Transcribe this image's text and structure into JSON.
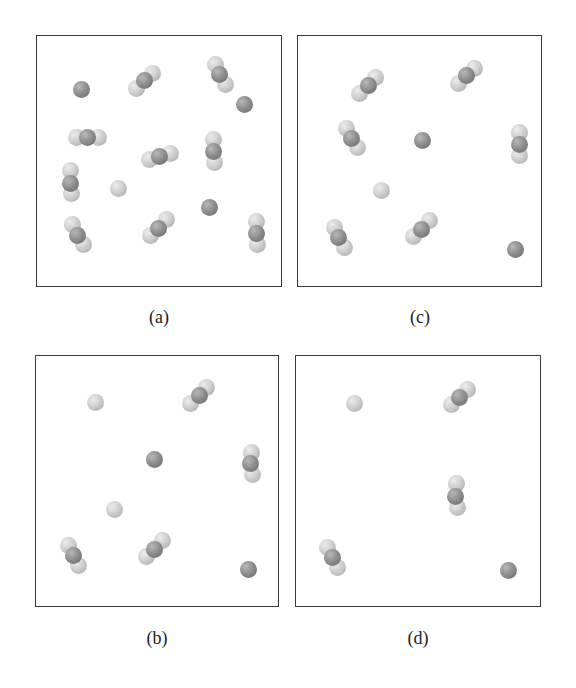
{
  "figure": {
    "atom_colors": {
      "light": "#cfcfcf",
      "dark": "#8f8f8f"
    },
    "panels": [
      {
        "id": "a",
        "label": "(a)",
        "box": {
          "left": 36,
          "top": 35,
          "width": 246,
          "height": 252
        },
        "label_pos": {
          "x": 159,
          "y": 307
        },
        "molecules": [
          {
            "type": "atom",
            "atoms": [
              {
                "x": 44,
                "y": 53,
                "c": "dark"
              }
            ]
          },
          {
            "type": "triatomic",
            "atoms": [
              {
                "x": 115,
                "y": 37,
                "c": "light"
              },
              {
                "x": 99,
                "y": 52,
                "c": "light"
              },
              {
                "x": 107,
                "y": 44,
                "c": "dark"
              }
            ]
          },
          {
            "type": "triatomic",
            "atoms": [
              {
                "x": 178,
                "y": 28,
                "c": "light"
              },
              {
                "x": 188,
                "y": 48,
                "c": "light"
              },
              {
                "x": 182,
                "y": 38,
                "c": "dark"
              }
            ]
          },
          {
            "type": "atom",
            "atoms": [
              {
                "x": 207,
                "y": 68,
                "c": "dark"
              }
            ]
          },
          {
            "type": "triatomic",
            "atoms": [
              {
                "x": 39,
                "y": 101,
                "c": "light"
              },
              {
                "x": 61,
                "y": 101,
                "c": "light"
              },
              {
                "x": 50,
                "y": 101,
                "c": "dark"
              }
            ]
          },
          {
            "type": "triatomic",
            "atoms": [
              {
                "x": 133,
                "y": 117,
                "c": "light"
              },
              {
                "x": 112,
                "y": 123,
                "c": "light"
              },
              {
                "x": 122,
                "y": 120,
                "c": "dark"
              }
            ]
          },
          {
            "type": "triatomic",
            "atoms": [
              {
                "x": 176,
                "y": 103,
                "c": "light"
              },
              {
                "x": 177,
                "y": 126,
                "c": "light"
              },
              {
                "x": 176,
                "y": 115,
                "c": "dark"
              }
            ]
          },
          {
            "type": "triatomic",
            "atoms": [
              {
                "x": 33,
                "y": 134,
                "c": "light"
              },
              {
                "x": 34,
                "y": 157,
                "c": "light"
              },
              {
                "x": 33,
                "y": 147,
                "c": "dark"
              }
            ]
          },
          {
            "type": "atom",
            "atoms": [
              {
                "x": 81,
                "y": 152,
                "c": "light"
              }
            ]
          },
          {
            "type": "atom",
            "atoms": [
              {
                "x": 172,
                "y": 171,
                "c": "dark"
              }
            ]
          },
          {
            "type": "triatomic",
            "atoms": [
              {
                "x": 35,
                "y": 188,
                "c": "light"
              },
              {
                "x": 46,
                "y": 208,
                "c": "light"
              },
              {
                "x": 40,
                "y": 199,
                "c": "dark"
              }
            ]
          },
          {
            "type": "triatomic",
            "atoms": [
              {
                "x": 129,
                "y": 183,
                "c": "light"
              },
              {
                "x": 113,
                "y": 199,
                "c": "light"
              },
              {
                "x": 121,
                "y": 192,
                "c": "dark"
              }
            ]
          },
          {
            "type": "triatomic",
            "atoms": [
              {
                "x": 219,
                "y": 185,
                "c": "light"
              },
              {
                "x": 220,
                "y": 208,
                "c": "light"
              },
              {
                "x": 219,
                "y": 197,
                "c": "dark"
              }
            ]
          }
        ]
      },
      {
        "id": "c",
        "label": "(c)",
        "box": {
          "left": 297,
          "top": 35,
          "width": 245,
          "height": 252
        },
        "label_pos": {
          "x": 420,
          "y": 307
        },
        "molecules": [
          {
            "type": "triatomic",
            "atoms": [
              {
                "x": 77,
                "y": 41,
                "c": "light"
              },
              {
                "x": 61,
                "y": 57,
                "c": "light"
              },
              {
                "x": 70,
                "y": 49,
                "c": "dark"
              }
            ]
          },
          {
            "type": "triatomic",
            "atoms": [
              {
                "x": 176,
                "y": 32,
                "c": "light"
              },
              {
                "x": 160,
                "y": 47,
                "c": "light"
              },
              {
                "x": 168,
                "y": 39,
                "c": "dark"
              }
            ]
          },
          {
            "type": "triatomic",
            "atoms": [
              {
                "x": 48,
                "y": 92,
                "c": "light"
              },
              {
                "x": 59,
                "y": 111,
                "c": "light"
              },
              {
                "x": 53,
                "y": 102,
                "c": "dark"
              }
            ]
          },
          {
            "type": "atom",
            "atoms": [
              {
                "x": 124,
                "y": 104,
                "c": "dark"
              }
            ]
          },
          {
            "type": "triatomic",
            "atoms": [
              {
                "x": 221,
                "y": 96,
                "c": "light"
              },
              {
                "x": 221,
                "y": 119,
                "c": "light"
              },
              {
                "x": 221,
                "y": 108,
                "c": "dark"
              }
            ]
          },
          {
            "type": "atom",
            "atoms": [
              {
                "x": 83,
                "y": 154,
                "c": "light"
              }
            ]
          },
          {
            "type": "triatomic",
            "atoms": [
              {
                "x": 36,
                "y": 191,
                "c": "light"
              },
              {
                "x": 46,
                "y": 211,
                "c": "light"
              },
              {
                "x": 40,
                "y": 201,
                "c": "dark"
              }
            ]
          },
          {
            "type": "triatomic",
            "atoms": [
              {
                "x": 131,
                "y": 184,
                "c": "light"
              },
              {
                "x": 115,
                "y": 200,
                "c": "light"
              },
              {
                "x": 123,
                "y": 193,
                "c": "dark"
              }
            ]
          },
          {
            "type": "atom",
            "atoms": [
              {
                "x": 217,
                "y": 213,
                "c": "dark"
              }
            ]
          }
        ]
      },
      {
        "id": "b",
        "label": "(b)",
        "box": {
          "left": 35,
          "top": 355,
          "width": 244,
          "height": 252
        },
        "label_pos": {
          "x": 157,
          "y": 628
        },
        "molecules": [
          {
            "type": "atom",
            "atoms": [
              {
                "x": 59,
                "y": 46,
                "c": "light"
              }
            ]
          },
          {
            "type": "triatomic",
            "atoms": [
              {
                "x": 170,
                "y": 31,
                "c": "light"
              },
              {
                "x": 154,
                "y": 47,
                "c": "light"
              },
              {
                "x": 163,
                "y": 39,
                "c": "dark"
              }
            ]
          },
          {
            "type": "atom",
            "atoms": [
              {
                "x": 118,
                "y": 103,
                "c": "dark"
              }
            ]
          },
          {
            "type": "triatomic",
            "atoms": [
              {
                "x": 215,
                "y": 96,
                "c": "light"
              },
              {
                "x": 216,
                "y": 118,
                "c": "light"
              },
              {
                "x": 214,
                "y": 107,
                "c": "dark"
              }
            ]
          },
          {
            "type": "atom",
            "atoms": [
              {
                "x": 78,
                "y": 153,
                "c": "light"
              }
            ]
          },
          {
            "type": "triatomic",
            "atoms": [
              {
                "x": 32,
                "y": 189,
                "c": "light"
              },
              {
                "x": 42,
                "y": 209,
                "c": "light"
              },
              {
                "x": 37,
                "y": 199,
                "c": "dark"
              }
            ]
          },
          {
            "type": "triatomic",
            "atoms": [
              {
                "x": 126,
                "y": 184,
                "c": "light"
              },
              {
                "x": 110,
                "y": 200,
                "c": "light"
              },
              {
                "x": 118,
                "y": 193,
                "c": "dark"
              }
            ]
          },
          {
            "type": "atom",
            "atoms": [
              {
                "x": 212,
                "y": 213,
                "c": "dark"
              }
            ]
          }
        ]
      },
      {
        "id": "d",
        "label": "(d)",
        "box": {
          "left": 295,
          "top": 355,
          "width": 246,
          "height": 252
        },
        "label_pos": {
          "x": 418,
          "y": 628
        },
        "molecules": [
          {
            "type": "atom",
            "atoms": [
              {
                "x": 58,
                "y": 47,
                "c": "light"
              }
            ]
          },
          {
            "type": "triatomic",
            "atoms": [
              {
                "x": 171,
                "y": 33,
                "c": "light"
              },
              {
                "x": 155,
                "y": 48,
                "c": "light"
              },
              {
                "x": 163,
                "y": 41,
                "c": "dark"
              }
            ]
          },
          {
            "type": "triatomic",
            "atoms": [
              {
                "x": 160,
                "y": 127,
                "c": "light"
              },
              {
                "x": 161,
                "y": 151,
                "c": "light"
              },
              {
                "x": 159,
                "y": 140,
                "c": "dark"
              }
            ]
          },
          {
            "type": "triatomic",
            "atoms": [
              {
                "x": 31,
                "y": 191,
                "c": "light"
              },
              {
                "x": 41,
                "y": 211,
                "c": "light"
              },
              {
                "x": 36,
                "y": 201,
                "c": "dark"
              }
            ]
          },
          {
            "type": "atom",
            "atoms": [
              {
                "x": 212,
                "y": 214,
                "c": "dark"
              }
            ]
          }
        ]
      }
    ]
  }
}
